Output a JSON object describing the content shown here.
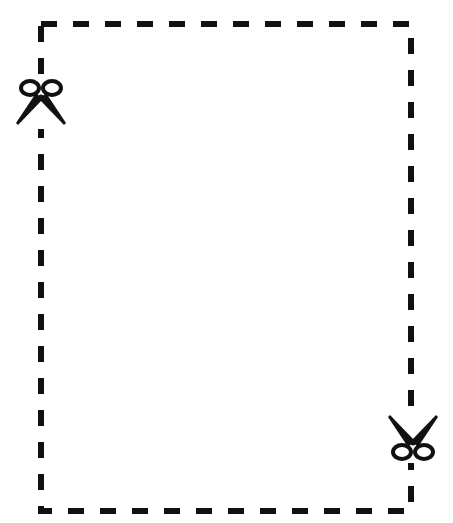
{
  "canvas": {
    "width": 453,
    "height": 523,
    "background": "#ffffff"
  },
  "cut_border": {
    "style": "dashed",
    "color": "#111111",
    "left": 41,
    "top": 24,
    "right": 411,
    "bottom": 511,
    "stroke_width": 6,
    "dash_length": 16,
    "gap_length": 16
  },
  "icons": [
    {
      "name": "scissors-icon",
      "position": "left-edge",
      "orientation": "blades-down"
    },
    {
      "name": "scissors-icon",
      "position": "right-edge",
      "orientation": "blades-up"
    }
  ],
  "labels": {
    "title": "Cut-out coupon border"
  }
}
